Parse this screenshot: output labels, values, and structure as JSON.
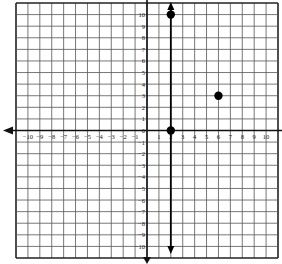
{
  "chart_data": {
    "type": "scatter",
    "title": "",
    "xlabel": "",
    "ylabel": "",
    "xlim": [
      -11,
      11
    ],
    "ylim": [
      -11,
      11
    ],
    "grid": true,
    "x_tick_labels": [
      "−10",
      "−9",
      "−8",
      "−7",
      "−6",
      "−5",
      "−4",
      "−3",
      "−2",
      "−1",
      "1",
      "2",
      "3",
      "4",
      "5",
      "6",
      "7",
      "8",
      "9",
      "10"
    ],
    "x_ticks": [
      -10,
      -9,
      -8,
      -7,
      -6,
      -5,
      -4,
      -3,
      -2,
      -1,
      1,
      2,
      3,
      4,
      5,
      6,
      7,
      8,
      9,
      10
    ],
    "y_tick_labels": [
      "10",
      "9",
      "8",
      "7",
      "6",
      "5",
      "4",
      "3",
      "2",
      "1",
      "0",
      "−1",
      "−2",
      "−3",
      "−4",
      "−5",
      "−6",
      "−7",
      "−8",
      "−9",
      "−10"
    ],
    "y_ticks": [
      10,
      9,
      8,
      7,
      6,
      5,
      4,
      3,
      2,
      1,
      0,
      -1,
      -2,
      -3,
      -4,
      -5,
      -6,
      -7,
      -8,
      -9,
      -10
    ],
    "points": [
      {
        "x": 2,
        "y": 10
      },
      {
        "x": 2,
        "y": 0
      },
      {
        "x": 6,
        "y": 3
      }
    ],
    "lines": [
      {
        "type": "vertical",
        "x": 2,
        "arrows": "both",
        "label": "x = 2"
      }
    ],
    "axes_arrows": {
      "x": "left",
      "y": "down"
    }
  },
  "colors": {
    "grid": "#555555",
    "axis": "#111111",
    "point": "#000000"
  }
}
